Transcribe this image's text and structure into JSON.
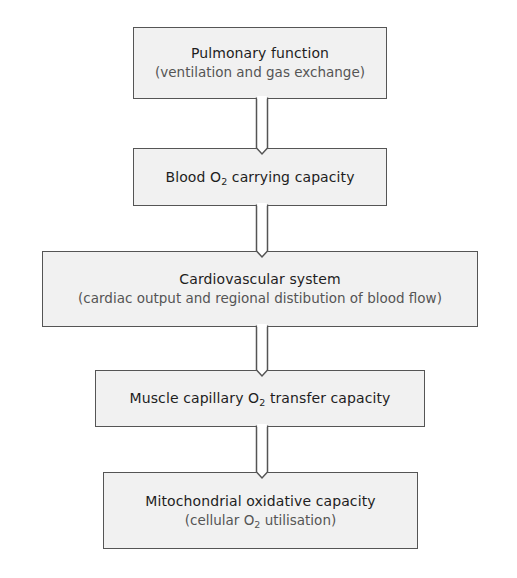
{
  "diagram": {
    "type": "flowchart",
    "direction": "top-to-bottom",
    "colors": {
      "box_fill": "#f1f1f1",
      "box_border": "#555555",
      "title_text": "#1e1e1e",
      "subtitle_text": "#555555",
      "background": "#ffffff"
    },
    "boxes": [
      {
        "id": "pulmonary-function",
        "title": "Pulmonary function",
        "subtitle": "(ventilation and gas exchange)"
      },
      {
        "id": "blood-o2-carrying-capacity",
        "title_pre": "Blood O",
        "title_sub": "2",
        "title_post": " carrying capacity"
      },
      {
        "id": "cardiovascular-system",
        "title": "Cardiovascular system",
        "subtitle": "(cardiac output and regional distibution of blood flow)"
      },
      {
        "id": "muscle-capillary-o2-transfer",
        "title_pre": "Muscle capillary O",
        "title_sub": "2",
        "title_post": " transfer capacity"
      },
      {
        "id": "mitochondrial-oxidative-capacity",
        "title": "Mitochondrial oxidative capacity",
        "subtitle_pre": "(cellular O",
        "subtitle_sub": "2",
        "subtitle_post": " utilisation)"
      }
    ],
    "edges": [
      {
        "from": "pulmonary-function",
        "to": "blood-o2-carrying-capacity"
      },
      {
        "from": "blood-o2-carrying-capacity",
        "to": "cardiovascular-system"
      },
      {
        "from": "cardiovascular-system",
        "to": "muscle-capillary-o2-transfer"
      },
      {
        "from": "muscle-capillary-o2-transfer",
        "to": "mitochondrial-oxidative-capacity"
      }
    ]
  }
}
